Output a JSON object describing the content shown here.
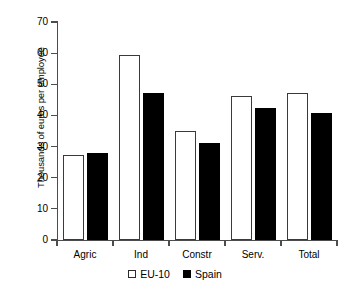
{
  "chart_data": {
    "type": "bar",
    "title": "",
    "xlabel": "",
    "ylabel": "Thousands of euros per employee",
    "categories": [
      "Agric",
      "Ind",
      "Constr",
      "Serv.",
      "Total"
    ],
    "series": [
      {
        "name": "EU-10",
        "color": "#ffffff",
        "values": [
          27.3,
          59.3,
          34.9,
          46.1,
          47.1
        ]
      },
      {
        "name": "Spain",
        "color": "#000000",
        "values": [
          28.0,
          47.3,
          31.2,
          42.3,
          40.7
        ]
      }
    ],
    "ylim": [
      0,
      70
    ],
    "ytick_labels": [
      "0",
      "10",
      "20",
      "30",
      "40",
      "50",
      "60",
      "70"
    ],
    "ytick_values": [
      0,
      10,
      20,
      30,
      40,
      50,
      60,
      70
    ],
    "grid": false,
    "legend_position": "bottom-center",
    "legend": [
      {
        "label": "EU-10",
        "swatch": "open-square"
      },
      {
        "label": "Spain",
        "swatch": "filled-square"
      }
    ],
    "axis_color": "#4d4d4d",
    "bar_edge_color": "#3a3a3a"
  }
}
